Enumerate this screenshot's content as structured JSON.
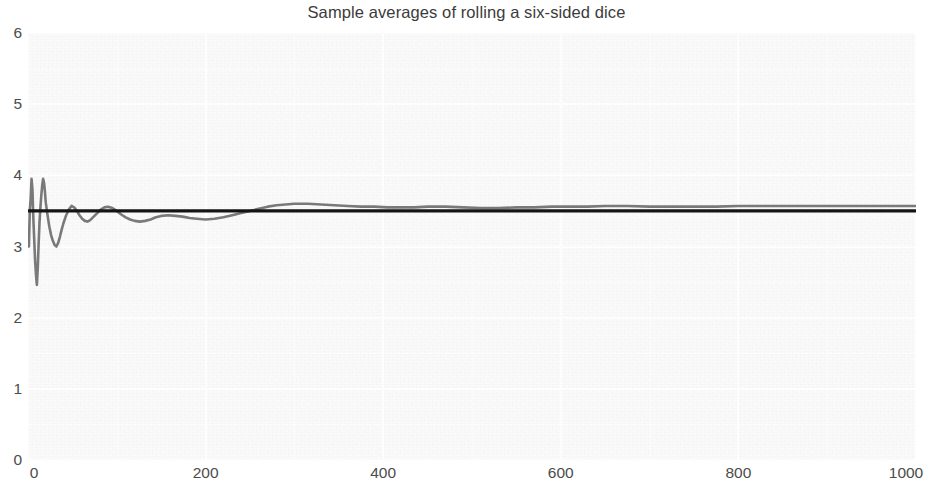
{
  "chart_data": {
    "type": "line",
    "title": "Sample averages of rolling a six-sided dice",
    "xlabel": "",
    "ylabel": "",
    "xlim": [
      0,
      1000
    ],
    "ylim": [
      0,
      6
    ],
    "grid": true,
    "legend": null,
    "xticks": [
      "0",
      "200",
      "400",
      "600",
      "800",
      "1000"
    ],
    "xtick_values": [
      0,
      200,
      400,
      600,
      800,
      1000
    ],
    "yticks": [
      "0",
      "1",
      "2",
      "3",
      "4",
      "5",
      "6"
    ],
    "ytick_values": [
      0,
      1,
      2,
      3,
      4,
      5,
      6
    ],
    "colors": {
      "running_average_line": "#7a7a7a",
      "expected_value_line": "#141414",
      "panel_background": "#fafafa",
      "gridline": "#ffffff",
      "title_text": "#3b3b3b",
      "tick_text": "#4c4c4c"
    },
    "series": [
      {
        "name": "Expected value",
        "type": "hline",
        "value": 3.5,
        "color": "#141414",
        "linewidth": 3
      },
      {
        "name": "Running sample average",
        "type": "line",
        "color": "#7a7a7a",
        "linewidth": 2.6,
        "x": [
          1,
          2,
          3,
          4,
          5,
          6,
          7,
          8,
          9,
          10,
          11,
          12,
          13,
          14,
          15,
          16,
          17,
          18,
          19,
          20,
          22,
          24,
          26,
          28,
          30,
          32,
          34,
          36,
          38,
          40,
          43,
          46,
          49,
          52,
          55,
          58,
          61,
          64,
          67,
          70,
          74,
          78,
          82,
          86,
          90,
          95,
          100,
          105,
          110,
          115,
          120,
          126,
          132,
          138,
          144,
          150,
          158,
          166,
          174,
          182,
          190,
          200,
          210,
          220,
          230,
          240,
          250,
          260,
          270,
          280,
          290,
          300,
          315,
          330,
          345,
          360,
          375,
          390,
          405,
          420,
          435,
          450,
          470,
          490,
          510,
          530,
          550,
          570,
          590,
          610,
          630,
          650,
          675,
          700,
          725,
          750,
          775,
          800,
          825,
          850,
          875,
          900,
          925,
          950,
          975,
          1000
        ],
        "y": [
          3.0,
          3.5,
          3.67,
          3.95,
          3.8,
          3.4,
          3.1,
          2.8,
          2.6,
          2.46,
          2.7,
          3.05,
          3.35,
          3.55,
          3.72,
          3.86,
          3.95,
          3.9,
          3.78,
          3.62,
          3.44,
          3.28,
          3.16,
          3.08,
          3.02,
          3.0,
          3.05,
          3.14,
          3.24,
          3.33,
          3.44,
          3.52,
          3.57,
          3.55,
          3.5,
          3.44,
          3.39,
          3.36,
          3.35,
          3.37,
          3.42,
          3.47,
          3.52,
          3.55,
          3.56,
          3.54,
          3.5,
          3.45,
          3.41,
          3.38,
          3.36,
          3.35,
          3.36,
          3.38,
          3.41,
          3.43,
          3.44,
          3.43,
          3.42,
          3.4,
          3.39,
          3.38,
          3.39,
          3.41,
          3.44,
          3.47,
          3.5,
          3.53,
          3.56,
          3.58,
          3.59,
          3.6,
          3.6,
          3.59,
          3.58,
          3.57,
          3.56,
          3.56,
          3.55,
          3.55,
          3.55,
          3.56,
          3.56,
          3.55,
          3.54,
          3.54,
          3.55,
          3.55,
          3.56,
          3.56,
          3.56,
          3.57,
          3.57,
          3.56,
          3.56,
          3.56,
          3.56,
          3.57,
          3.57,
          3.57,
          3.57,
          3.57,
          3.57,
          3.57,
          3.57,
          3.57
        ]
      }
    ],
    "annotations": [
      {
        "text": "Running average fluctuates widely for small n (range about 2.45 to 3.95) then converges toward the expected value 3.5",
        "visible": false
      }
    ]
  },
  "figure": {
    "width": 933,
    "height": 485,
    "background": "#ffffff"
  }
}
